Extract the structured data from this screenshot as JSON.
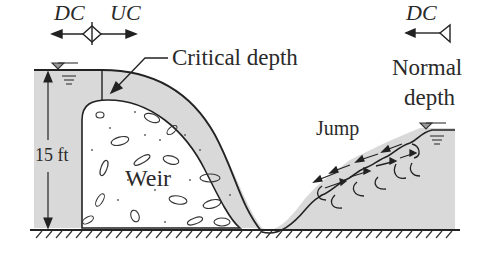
{
  "labels": {
    "dc_left": "DC",
    "uc": "UC",
    "dc_right": "DC",
    "critical_depth": "Critical depth",
    "normal_depth_line1": "Normal",
    "normal_depth_line2": "depth",
    "jump": "Jump",
    "height": "15 ft",
    "weir": "Weir"
  },
  "colors": {
    "water": "#d9d9d9",
    "line": "#222222",
    "text": "#2a2a2a"
  }
}
